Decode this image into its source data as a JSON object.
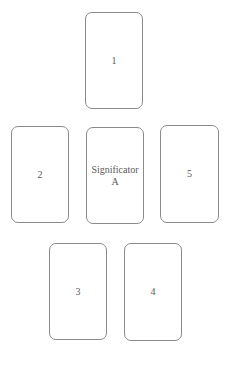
{
  "spread": {
    "cards": [
      {
        "position": "top",
        "label": "1"
      },
      {
        "position": "middle-left",
        "label": "2"
      },
      {
        "position": "middle-center",
        "label": "Significator\nA"
      },
      {
        "position": "middle-right",
        "label": "5"
      },
      {
        "position": "bottom-left",
        "label": "3"
      },
      {
        "position": "bottom-right",
        "label": "4"
      }
    ]
  },
  "colors": {
    "card_border": "#8a8a8a",
    "card_text": "#5a5a5a",
    "background": "#ffffff"
  }
}
